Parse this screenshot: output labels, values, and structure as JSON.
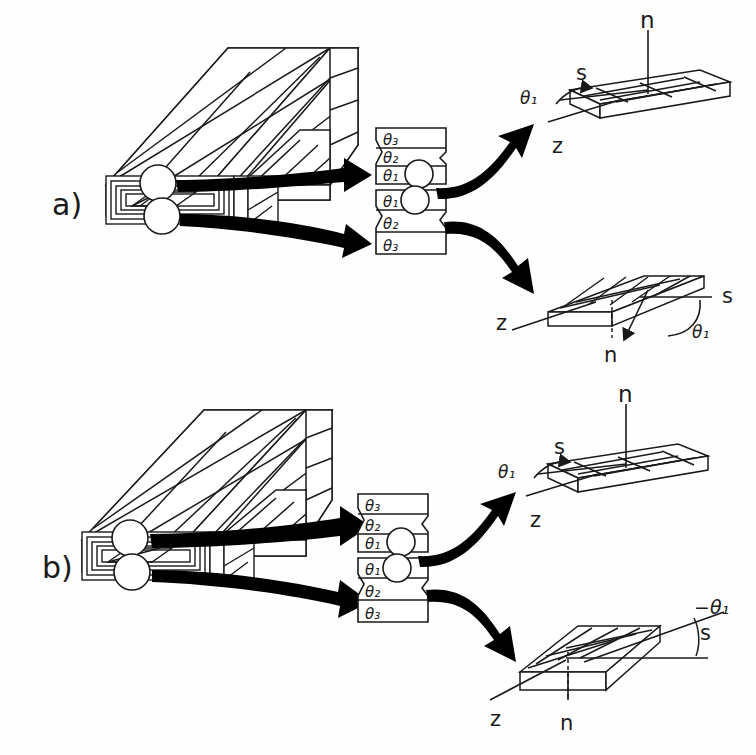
{
  "figure": {
    "domain": "technical-diagram",
    "background_color": "#fefefe",
    "ink_color": "#1a1a1a",
    "arrow_color": "#000000"
  },
  "panels": [
    {
      "id": "a",
      "label": "a)",
      "block": {
        "name": "laminate-block-a"
      },
      "stacks": [
        {
          "id": "a-top",
          "layers": [
            "θ₃",
            "θ₂",
            "θ₁"
          ]
        },
        {
          "id": "a-bottom",
          "layers": [
            "θ₁",
            "θ₂",
            "θ₃"
          ]
        }
      ],
      "plates": [
        {
          "id": "a-plate-top",
          "normal_label": "n",
          "s_label": "s",
          "z_label": "z",
          "angle_label": "θ₁",
          "orientation": "flat"
        },
        {
          "id": "a-plate-bottom",
          "normal_label": "n",
          "s_label": "s",
          "z_label": "z",
          "angle_label": "θ₁",
          "orientation": "tilted"
        }
      ]
    },
    {
      "id": "b",
      "label": "b)",
      "block": {
        "name": "laminate-block-b"
      },
      "stacks": [
        {
          "id": "b-top",
          "layers": [
            "θ₃",
            "θ₂",
            "θ₁"
          ]
        },
        {
          "id": "b-bottom",
          "layers": [
            "θ₁",
            "θ₂",
            "θ₃"
          ]
        }
      ],
      "plates": [
        {
          "id": "b-plate-top",
          "normal_label": "n",
          "s_label": "s",
          "z_label": "z",
          "angle_label": "θ₁",
          "orientation": "flat"
        },
        {
          "id": "b-plate-bottom",
          "normal_label": "n",
          "s_label": "s",
          "z_label": "z",
          "angle_label": "−θ₁",
          "orientation": "tilted-negative"
        }
      ]
    }
  ]
}
